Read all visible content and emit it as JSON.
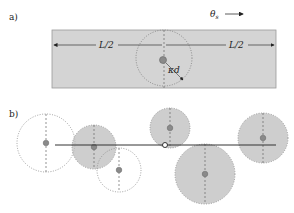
{
  "panel_a": {
    "label": "a)",
    "flow_label": "θ",
    "flow_sub": "s",
    "half_length_left": "L/2",
    "half_length_right": "L/2",
    "radius_label": "κd",
    "colors": {
      "band": "#d4d4d4",
      "band_border": "#999999",
      "particle": "#8a8a8a"
    }
  },
  "panel_b": {
    "label": "b)",
    "circles": [
      {
        "cx": 46,
        "cy": 143,
        "r": 29,
        "shaded": false
      },
      {
        "cx": 94,
        "cy": 147,
        "r": 22,
        "shaded": true
      },
      {
        "cx": 119,
        "cy": 170,
        "r": 22,
        "shaded": false
      },
      {
        "cx": 170,
        "cy": 128,
        "r": 20,
        "shaded": true
      },
      {
        "cx": 205,
        "cy": 174,
        "r": 30,
        "shaded": true
      },
      {
        "cx": 263,
        "cy": 138,
        "r": 25,
        "shaded": true
      }
    ],
    "line": {
      "x1": 55,
      "x2": 276,
      "y": 145
    },
    "marker": {
      "cx": 165,
      "cy": 145
    }
  }
}
